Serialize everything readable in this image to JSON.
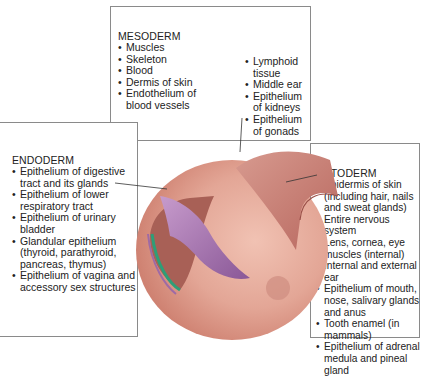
{
  "diagram": {
    "mesoderm": {
      "title": "MESODERM",
      "color": "#2e9e78",
      "column1": [
        "Muscles",
        "Skeleton",
        "Blood",
        "Dermis of skin",
        "Endothelium of blood vessels"
      ],
      "column2": [
        "Lymphoid tissue",
        "Middle ear",
        "Epithelium of kidneys",
        "Epithelium of gonads"
      ]
    },
    "endoderm": {
      "title": "ENDODERM",
      "color": "#9e6aa6",
      "items": [
        "Epithelium of digestive tract and its glands",
        "Epithelium of lower respiratory tract",
        "Epithelium of urinary bladder",
        "Glandular epithelium (thyroid, parathyroid, pancreas, thymus)",
        "Epithelium of vagina and accessory sex structures"
      ]
    },
    "ectoderm": {
      "title": "ECTODERM",
      "color": "#c97a72",
      "items": [
        "Epidermis of skin (including hair, nails and sweat glands)",
        "Entire nervous system",
        "Lens, cornea, eye muscles (internal)",
        "Internal and external ear",
        "Epithelium of mouth, nose, salivary glands and anus",
        "Tooth enamel (in mammals)",
        "Epithelium of adrenal medula and pineal gland"
      ]
    },
    "embryo_color": "#e0a497"
  }
}
